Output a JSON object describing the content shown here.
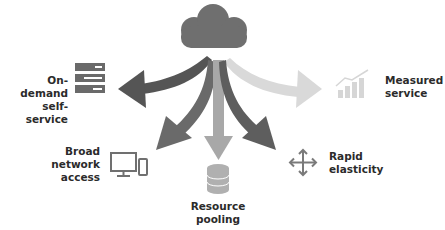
{
  "diagram": {
    "center": {
      "icon": "cloud-icon",
      "color": "#6f6f6f"
    },
    "characteristics": [
      {
        "id": "on-demand",
        "lines": [
          "On-demand",
          "self-service"
        ],
        "icon": "server-rack-icon",
        "arrow_color": "#555555"
      },
      {
        "id": "measured",
        "lines": [
          "Measured",
          "service"
        ],
        "icon": "bar-chart-trend-icon",
        "arrow_color": "#d8d8d8"
      },
      {
        "id": "broad-network",
        "lines": [
          "Broad",
          "network",
          "access"
        ],
        "icon": "monitor-phone-icon",
        "arrow_color": "#6a6a6a"
      },
      {
        "id": "resource-pooling",
        "lines": [
          "Resource",
          "pooling"
        ],
        "icon": "database-icon",
        "arrow_color": "#a8a8a8"
      },
      {
        "id": "rapid-elasticity",
        "lines": [
          "Rapid",
          "elasticity"
        ],
        "icon": "move-arrows-icon",
        "arrow_color": "#5e5e5e"
      }
    ]
  }
}
